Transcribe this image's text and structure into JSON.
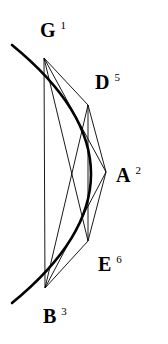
{
  "figure": {
    "background_color": "#ffffff",
    "stroke_color": "#000000",
    "arc_stroke_width": 2.6,
    "chord_stroke_width": 0.9,
    "canvas": {
      "width": 168,
      "height": 344
    },
    "arc": {
      "name": "outer-arc",
      "start": {
        "x": 12,
        "y": 45
      },
      "end": {
        "x": 12,
        "y": 303
      },
      "control": {
        "x": 170,
        "y": 174
      }
    },
    "vertices": [
      {
        "id": "G",
        "letter": "G",
        "index": "1",
        "point": {
          "x": 44,
          "y": 58
        },
        "label": {
          "x": 40,
          "y": 20
        }
      },
      {
        "id": "D",
        "letter": "D",
        "index": "5",
        "point": {
          "x": 88,
          "y": 105
        },
        "label": {
          "x": 95,
          "y": 72
        }
      },
      {
        "id": "A",
        "letter": "A",
        "index": "2",
        "point": {
          "x": 106,
          "y": 172
        },
        "label": {
          "x": 116,
          "y": 165
        }
      },
      {
        "id": "E",
        "letter": "E",
        "index": "6",
        "point": {
          "x": 88,
          "y": 241
        },
        "label": {
          "x": 98,
          "y": 254
        }
      },
      {
        "id": "B",
        "letter": "B",
        "index": "3",
        "point": {
          "x": 45,
          "y": 288
        },
        "label": {
          "x": 43,
          "y": 306
        }
      }
    ],
    "chords": [
      {
        "id": "G-D",
        "from": "G",
        "to": "D"
      },
      {
        "id": "G-A",
        "from": "G",
        "to": "A"
      },
      {
        "id": "G-E",
        "from": "G",
        "to": "E"
      },
      {
        "id": "G-B",
        "from": "G",
        "to": "B"
      },
      {
        "id": "D-A",
        "from": "D",
        "to": "A"
      },
      {
        "id": "D-E",
        "from": "D",
        "to": "E"
      },
      {
        "id": "D-B",
        "from": "D",
        "to": "B"
      },
      {
        "id": "A-E",
        "from": "A",
        "to": "E"
      },
      {
        "id": "A-B",
        "from": "A",
        "to": "B"
      },
      {
        "id": "E-B",
        "from": "E",
        "to": "B"
      }
    ]
  }
}
